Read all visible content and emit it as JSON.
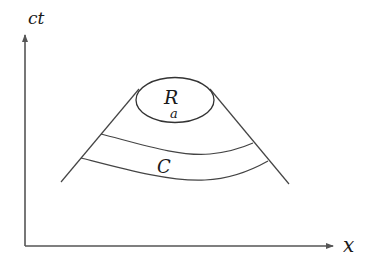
{
  "diagram": {
    "axes": {
      "y_label": "ct",
      "x_label": "x",
      "color": "#555555"
    },
    "region": {
      "label_main": "R",
      "label_sub": "a"
    },
    "band": {
      "label": "C"
    },
    "line_color": "#444444"
  }
}
